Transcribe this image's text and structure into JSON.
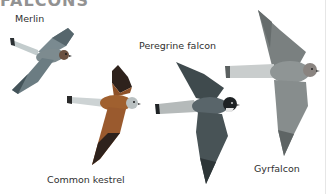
{
  "page": {
    "title_partial": "FALCONS"
  },
  "birds": [
    {
      "id": "merlin",
      "label": "Merlin",
      "colors": {
        "back": "#6f7e84",
        "wing_dark": "#4a5a60",
        "tail": "#b9c4c6",
        "head": "#6b5040"
      }
    },
    {
      "id": "common-kestrel",
      "label": "Common kestrel",
      "colors": {
        "back": "#9a5a2e",
        "wing_dark": "#2e221c",
        "tail": "#c9cfd0",
        "head": "#b8bfc0"
      }
    },
    {
      "id": "peregrine-falcon",
      "label": "Peregrine falcon",
      "colors": {
        "back": "#4f5a5c",
        "wing_dark": "#3b4446",
        "tail": "#b4b9b9",
        "head": "#1e2224"
      }
    },
    {
      "id": "gyrfalcon",
      "label": "Gyrfalcon",
      "colors": {
        "back": "#8d9393",
        "wing_dark": "#6f7575",
        "tail": "#c4c9c9",
        "head": "#8a8480"
      }
    }
  ]
}
